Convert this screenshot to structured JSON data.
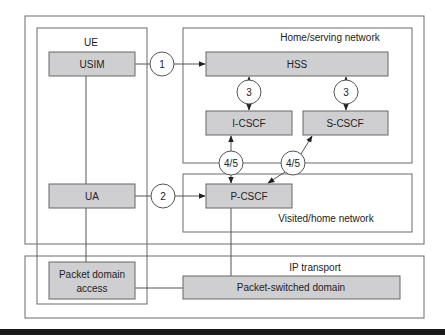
{
  "diagram": {
    "regions": {
      "ue": "UE",
      "home": "Home/serving network",
      "visited": "Visited/home network",
      "ip": "IP transport"
    },
    "nodes": {
      "usim": "USIM",
      "hss": "HSS",
      "icscf": "I-CSCF",
      "scscf": "S-CSCF",
      "ua": "UA",
      "pcscf": "P-CSCF",
      "pda_line1": "Packet domain",
      "pda_line2": "access",
      "psd": "Packet-switched domain"
    },
    "interfaces": {
      "i1": "1",
      "i2": "2",
      "i3a": "3",
      "i3b": "3",
      "i45a": "4/5",
      "i45b": "4/5"
    },
    "colors": {
      "node_fill": "#cfcfd2",
      "line": "#555555"
    }
  }
}
